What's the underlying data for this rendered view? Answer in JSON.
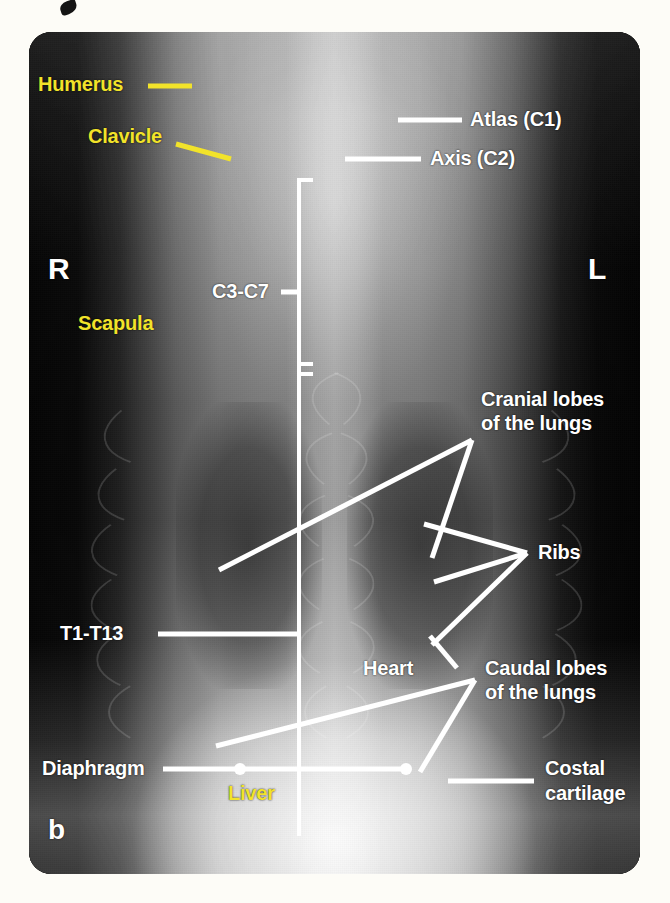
{
  "figure": {
    "panel_letter": "b",
    "caption_fragment": "",
    "orientation_markers": {
      "right": "R",
      "left": "L"
    },
    "background_color": "#fdfcf7",
    "film_color": "#070707",
    "label_color_white": "#ffffff",
    "label_color_yellow": "#f2e32a"
  },
  "labels": {
    "humerus": "Humerus",
    "clavicle": "Clavicle",
    "scapula": "Scapula",
    "atlas": "Atlas (C1)",
    "axis": "Axis (C2)",
    "c3_c7": "C3-C7",
    "t1_t13": "T1-T13",
    "cranial_lobes_line1": "Cranial lobes",
    "cranial_lobes_line2": "of the lungs",
    "caudal_lobes_line1": "Caudal lobes",
    "caudal_lobes_line2": "of the lungs",
    "ribs": "Ribs",
    "heart": "Heart",
    "diaphragm": "Diaphragm",
    "liver": "Liver",
    "costal_line1": "Costal",
    "costal_line2": "cartilage"
  },
  "annotation_groups": [
    {
      "name": "humerus",
      "color": "#f2e32a",
      "kind": "short-dash"
    },
    {
      "name": "clavicle",
      "color": "#f2e32a",
      "kind": "angled-leader"
    },
    {
      "name": "scapula",
      "color": "#f2e32a",
      "kind": "text-only"
    },
    {
      "name": "liver",
      "color": "#f2e32a",
      "kind": "text-only"
    },
    {
      "name": "atlas",
      "color": "#ffffff",
      "kind": "horizontal-leader"
    },
    {
      "name": "axis",
      "color": "#ffffff",
      "kind": "horizontal-leader"
    },
    {
      "name": "c3-c7",
      "color": "#ffffff",
      "kind": "vertical-bracket-tick"
    },
    {
      "name": "t1-t13",
      "color": "#ffffff",
      "kind": "horizontal-leader"
    },
    {
      "name": "cranial-lobes",
      "color": "#ffffff",
      "kind": "two-pointer-fan"
    },
    {
      "name": "ribs",
      "color": "#ffffff",
      "kind": "three-pointer-fan"
    },
    {
      "name": "heart",
      "color": "#ffffff",
      "kind": "angled-leader"
    },
    {
      "name": "caudal-lobes",
      "color": "#ffffff",
      "kind": "two-pointer-fan"
    },
    {
      "name": "diaphragm",
      "color": "#ffffff",
      "kind": "dotted-span-leader"
    },
    {
      "name": "costal-cartilage",
      "color": "#ffffff",
      "kind": "horizontal-leader"
    }
  ],
  "vertical_scale_bar": {
    "description": "vertical white reference line along the vertebral column with bracket ticks",
    "top_y": 178,
    "bottom_y": 836,
    "x": 299
  }
}
